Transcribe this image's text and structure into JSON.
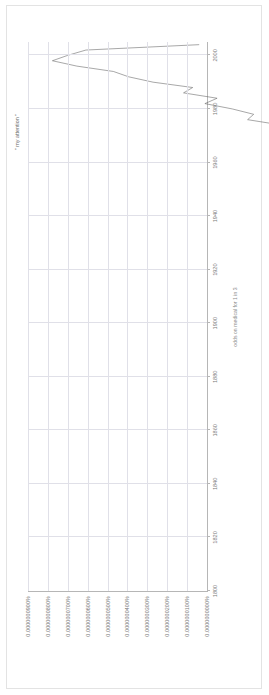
{
  "chart_data": {
    "type": "line",
    "title": "",
    "xlabel": "odds on medical for 1 in 3",
    "ylabel": "",
    "series_label": "\" my attention \"",
    "xlim": [
      1800,
      2005
    ],
    "ylim": [
      0,
      9e-10
    ],
    "grid": true,
    "legend_position": "inline-annotation",
    "x_tick_labels": [
      "1800",
      "1820",
      "1840",
      "1860",
      "1880",
      "1900",
      "1920",
      "1940",
      "1960",
      "1980",
      "2000"
    ],
    "x_ticks": [
      1800,
      1820,
      1840,
      1860,
      1880,
      1900,
      1920,
      1940,
      1960,
      1980,
      2000
    ],
    "y_tick_labels": [
      "0.0000000000%",
      "0.0000000100%",
      "0.0000000200%",
      "0.0000000300%",
      "0.0000000400%",
      "0.0000000500%",
      "0.0000000600%",
      "0.0000000700%",
      "0.0000000800%",
      "0.0000000900%"
    ],
    "y_ticks": [
      0,
      1e-10,
      2e-10,
      3e-10,
      4e-10,
      5e-10,
      6e-10,
      7e-10,
      8e-10,
      9e-10
    ],
    "series": [
      {
        "name": "\" my attention \"",
        "x": [
          1800,
          1804,
          1808,
          1812,
          1816,
          1820,
          1824,
          1828,
          1832,
          1836,
          1840,
          1843,
          1846,
          1848,
          1850,
          1852,
          1854,
          1856,
          1858,
          1860,
          1862,
          1864,
          1866,
          1868,
          1870,
          1872,
          1874,
          1876,
          1878,
          1880,
          1882,
          1884,
          1886,
          1888,
          1890,
          1892,
          1894,
          1896,
          1898,
          1900,
          1902,
          1904,
          1906,
          1908,
          1910,
          1912,
          1914,
          1916,
          1918,
          1920,
          1922,
          1924,
          1926,
          1928,
          1930,
          1932,
          1934,
          1936,
          1938,
          1940,
          1942,
          1944,
          1946,
          1948,
          1950,
          1952,
          1954,
          1956,
          1958,
          1960,
          1962,
          1964,
          1966,
          1968,
          1970,
          1972,
          1974,
          1976,
          1978,
          1980,
          1982,
          1984,
          1986,
          1988,
          1990,
          1992,
          1994,
          1996,
          1998,
          2000,
          2002,
          2004
        ],
        "values": [
          0,
          0,
          0,
          0,
          0,
          0,
          0,
          0,
          0,
          0,
          0,
          0,
          0.12,
          0.12,
          0.12,
          0.12,
          0.2,
          0.2,
          0.2,
          0.2,
          0.13,
          0.13,
          0.13,
          0.13,
          0.13,
          0.13,
          0.2,
          0.2,
          0.26,
          0.26,
          0.3,
          0.3,
          0.34,
          0.34,
          0.34,
          0.41,
          0.41,
          0.41,
          0.55,
          0.55,
          0.72,
          0.62,
          0.82,
          0.78,
          0.9,
          1.02,
          1.12,
          1.0,
          1.2,
          1.22,
          1.5,
          1.4,
          1.62,
          1.58,
          1.75,
          1.68,
          1.95,
          2.0,
          2.2,
          2.1,
          2.52,
          2.3,
          2.8,
          2.7,
          2.55,
          3.2,
          3.0,
          3.5,
          3.15,
          3.9,
          3.7,
          4.15,
          4.05,
          4.5,
          4.4,
          5.0,
          4.85,
          5.4,
          5.3,
          5.65,
          6.1,
          5.9,
          6.45,
          6.3,
          6.95,
          7.35,
          7.6,
          8.2,
          8.6,
          8.35,
          8.05,
          6.2
        ]
      }
    ],
    "value_scale_note": "values expressed in units of 1e-10 percent"
  },
  "colors": {
    "line": "#5f5f5f",
    "grid": "#e0e0e8",
    "axis": "#b6b6b6",
    "text": "#7a7a7a",
    "background": "#ffffff",
    "page_border": "#e3e3e3"
  }
}
